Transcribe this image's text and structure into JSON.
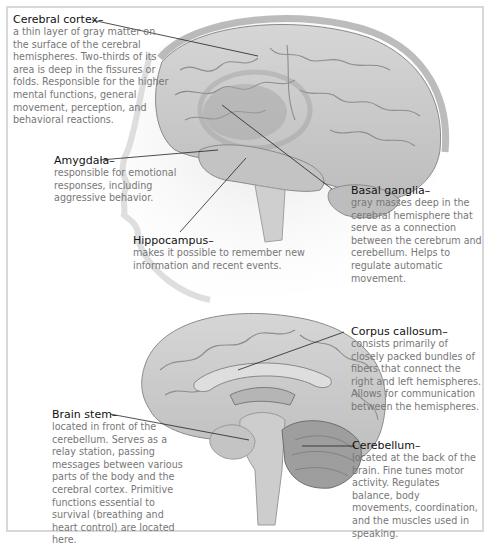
{
  "diagram": {
    "figures": [
      "lateral view of head and brain",
      "sagittal section of brain"
    ],
    "colors": {
      "title": "#111111",
      "body": "#777777",
      "frame": "#d8d8d8",
      "brain": "#c9c9c9",
      "leader": "#222222"
    }
  },
  "labels": {
    "cerebral_cortex": {
      "title": "Cerebral cortex–",
      "text": "a thin layer of gray matter on the surface of the cerebral hemispheres.  Two-thirds of its area is deep in the fissures or folds.  Responsible for the higher mental functions, general movement, perception, and behavioral reactions."
    },
    "amygdala": {
      "title": "Amygdala–",
      "text": "responsible for emotional responses, including aggressive behavior."
    },
    "hippocampus": {
      "title": "Hippocampus–",
      "text": "makes it possible to remember new information and recent events."
    },
    "basal_ganglia": {
      "title": "Basal ganglia–",
      "text": "gray masses deep in the cerebral hemisphere that serve as a connection between the cerebrum and cerebellum.  Helps to regulate automatic movement."
    },
    "corpus_callosum": {
      "title": "Corpus callosum–",
      "text": "consists primarily of closely packed bundles of fibers that connect the right and left hemispheres.  Allows for communication between the hemispheres."
    },
    "brain_stem": {
      "title": "Brain stem–",
      "text": "located in front of the cerebellum.  Serves as a relay station, passing messages between various parts of the body and the cerebral cortex. Primitive functions essential to survival (breathing and heart control) are located here."
    },
    "cerebellum": {
      "title": "Cerebellum–",
      "text": "located at the back of the brain.  Fine tunes motor activity.  Regulates balance, body movements, coordination, and the muscles used in speaking."
    }
  }
}
